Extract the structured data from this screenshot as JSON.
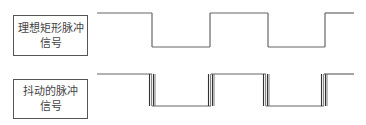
{
  "rows": [
    {
      "label_line1": "理想矩形脉冲",
      "label_line2": "信号",
      "type": "ideal",
      "high_y": 13,
      "low_y": 47,
      "edges": [
        152,
        210,
        268,
        325
      ],
      "start_x": 97,
      "end_x": 354
    },
    {
      "label_line1": "抖动的脉冲",
      "label_line2": "信号",
      "type": "jitter",
      "high_y": 74,
      "low_y": 106,
      "edges": [
        152,
        211,
        266,
        324
      ],
      "start_x": 97,
      "end_x": 354
    }
  ],
  "colors": {
    "line": "#666666",
    "jitter": "#333333",
    "box_border": "#555555",
    "text": "#444444"
  }
}
